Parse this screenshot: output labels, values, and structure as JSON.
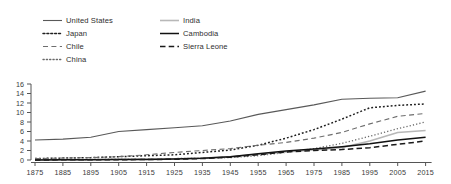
{
  "chart_data": {
    "type": "line",
    "title": "",
    "subtitle": "",
    "xlabel": "",
    "ylabel": "",
    "xlim": [
      1875,
      2015
    ],
    "ylim": [
      0,
      16
    ],
    "grid": false,
    "legend_position": "top-left",
    "x": [
      1875,
      1885,
      1895,
      1905,
      1915,
      1925,
      1935,
      1945,
      1955,
      1965,
      1975,
      1985,
      1995,
      2005,
      2015
    ],
    "xticks": [
      "1875",
      "1885",
      "1895",
      "1905",
      "1915",
      "1925",
      "1935",
      "1945",
      "1955",
      "1965",
      "1975",
      "1985",
      "1995",
      "2005",
      "2015"
    ],
    "yticks": [
      "0",
      "2",
      "4",
      "6",
      "8",
      "10",
      "12",
      "14",
      "16"
    ],
    "ytick_values": [
      0,
      2,
      4,
      6,
      8,
      10,
      12,
      14,
      16
    ],
    "series": [
      {
        "name": "United States",
        "style": "solid",
        "color": "#595959",
        "width": 1.1,
        "values": [
          4.2,
          4.4,
          4.8,
          6.0,
          6.4,
          6.8,
          7.2,
          8.2,
          9.6,
          10.6,
          11.6,
          12.8,
          13.0,
          13.1,
          14.5
        ]
      },
      {
        "name": "Japan",
        "style": "dotted",
        "color": "#1f1f1f",
        "width": 1.5,
        "values": [
          0.3,
          0.4,
          0.5,
          0.7,
          0.9,
          1.1,
          1.6,
          2.1,
          3.1,
          4.6,
          6.4,
          8.6,
          11.0,
          11.5,
          11.8
        ]
      },
      {
        "name": "Chile",
        "style": "dashed",
        "color": "#6e6e6e",
        "width": 1.1,
        "values": [
          0.3,
          0.4,
          0.5,
          0.7,
          1.1,
          1.6,
          2.0,
          2.4,
          3.1,
          3.7,
          4.6,
          5.8,
          7.6,
          9.2,
          9.8
        ]
      },
      {
        "name": "China",
        "style": "fine-dotted",
        "color": "#6a6a6a",
        "width": 1.3,
        "values": [
          0.1,
          0.1,
          0.1,
          0.2,
          0.2,
          0.3,
          0.4,
          0.5,
          0.9,
          1.6,
          2.4,
          3.5,
          5.0,
          6.6,
          8.0
        ]
      },
      {
        "name": "India",
        "style": "solid",
        "color": "#b8b8b8",
        "width": 1.6,
        "values": [
          0.05,
          0.08,
          0.1,
          0.15,
          0.2,
          0.25,
          0.4,
          0.7,
          1.2,
          1.7,
          2.1,
          2.6,
          4.0,
          5.8,
          6.2
        ]
      },
      {
        "name": "Cambodia",
        "style": "solid",
        "color": "#111111",
        "width": 1.5,
        "values": [
          0.02,
          0.03,
          0.05,
          0.08,
          0.12,
          0.2,
          0.35,
          0.7,
          1.3,
          1.9,
          2.3,
          2.8,
          3.4,
          4.2,
          4.8
        ]
      },
      {
        "name": "Sierra Leone",
        "style": "long-dashed",
        "color": "#1a1a1a",
        "width": 1.5,
        "values": [
          0.02,
          0.03,
          0.04,
          0.06,
          0.1,
          0.15,
          0.3,
          0.6,
          1.1,
          1.7,
          2.0,
          2.2,
          2.6,
          3.3,
          4.0
        ]
      }
    ],
    "legend": [
      {
        "label": "United States",
        "style": "solid",
        "color": "#595959"
      },
      {
        "label": "Japan",
        "style": "dotted",
        "color": "#1f1f1f"
      },
      {
        "label": "Chile",
        "style": "dashed",
        "color": "#6e6e6e"
      },
      {
        "label": "China",
        "style": "fine-dotted",
        "color": "#6a6a6a"
      },
      {
        "label": "India",
        "style": "solid",
        "color": "#b8b8b8"
      },
      {
        "label": "Cambodia",
        "style": "solid",
        "color": "#111111"
      },
      {
        "label": "Sierra Leone",
        "style": "long-dashed",
        "color": "#1a1a1a"
      }
    ],
    "axis_color": "#555555"
  }
}
